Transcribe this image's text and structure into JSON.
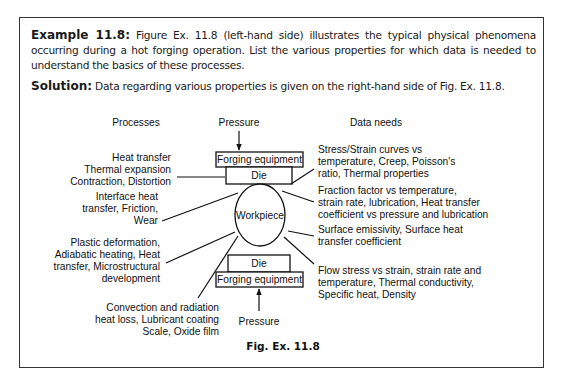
{
  "example": {
    "label": "Example 11.8:",
    "text": " Figure Ex. 11.8 (left-hand side) illustrates the typical physical phenomena occurring during a hot forging operation. List the various properties for which data is needed to understand the basics of these processes."
  },
  "solution": {
    "label": "Solution:",
    "text": " Data regarding various properties is given on the right-hand side of Fig. Ex. 11.8."
  },
  "figure": {
    "headers": {
      "processes": "Processes",
      "pressure_top": "Pressure",
      "data_needs": "Data needs"
    },
    "center": {
      "forging_equipment_top": "Forging equipment",
      "die_top": "Die",
      "workpiece": "Workpiece",
      "die_bottom": "Die",
      "forging_equipment_bottom": "Forging equipment",
      "pressure_bottom": "Pressure"
    },
    "processes": [
      {
        "lines": [
          "Heat transfer",
          "Thermal expansion",
          "Contraction, Distortion"
        ]
      },
      {
        "lines": [
          "Interface heat",
          "transfer, Friction,",
          "Wear"
        ]
      },
      {
        "lines": [
          "Plastic deformation,",
          "Adiabatic heating,  Heat",
          "transfer, Microstructural",
          "development"
        ]
      },
      {
        "lines": [
          "Convection and radiation",
          "heat loss, Lubricant coating",
          "Scale, Oxide film"
        ]
      }
    ],
    "data_needs": [
      {
        "lines": [
          "Stress/Strain curves vs",
          "temperature, Creep, Poisson's",
          "ratio, Thermal properties"
        ]
      },
      {
        "lines": [
          "Fraction factor vs temperature,",
          "strain rate, lubrication, Heat transfer",
          "coefficient vs pressure and lubrication"
        ]
      },
      {
        "lines": [
          "Surface emissivity, Surface heat",
          "transfer coefficient"
        ]
      },
      {
        "lines": [
          "Flow stress vs strain, strain rate and",
          "temperature, Thermal conductivity,",
          "Specific heat, Density"
        ]
      }
    ],
    "caption": "Fig. Ex. 11.8"
  }
}
